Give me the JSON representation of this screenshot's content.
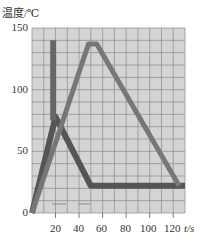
{
  "chart_data": {
    "type": "line",
    "title": "",
    "ylabel": "温度/℃",
    "xlabel": "t/s",
    "xlim": [
      0,
      130
    ],
    "ylim": [
      0,
      150
    ],
    "grid": true,
    "grid_step_x": 10,
    "grid_step_y": 10,
    "x_ticks": [
      20,
      40,
      60,
      80,
      100,
      120
    ],
    "y_ticks": [
      0,
      50,
      100,
      150
    ],
    "series": [
      {
        "name": "cooling-curve",
        "color": "#555555",
        "points": [
          [
            0,
            0
          ],
          [
            20,
            78
          ],
          [
            50,
            22
          ],
          [
            130,
            22
          ]
        ]
      },
      {
        "name": "heating-trapezoid",
        "color": "#777777",
        "points": [
          [
            0,
            0
          ],
          [
            48,
            137
          ],
          [
            55,
            137
          ],
          [
            125,
            22
          ]
        ]
      },
      {
        "name": "vertical-bar",
        "color": "#666666",
        "points": [
          [
            18,
            140
          ],
          [
            18,
            75
          ]
        ]
      }
    ],
    "legend": null
  },
  "axis": {
    "y_title": "温度/℃",
    "x_unit": "t/s",
    "y_tick_labels": [
      "150",
      "100",
      "50",
      "0"
    ],
    "x_tick_labels": [
      "20",
      "40",
      "60",
      "80",
      "100",
      "120"
    ]
  }
}
